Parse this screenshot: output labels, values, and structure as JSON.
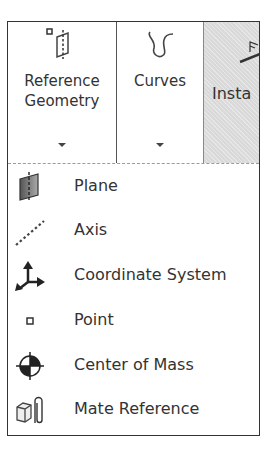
{
  "ribbon": {
    "buttons": [
      {
        "label": "Reference\nGeometry",
        "icon": "reference-geometry-icon",
        "has_dropdown": true
      },
      {
        "label": "Curves",
        "icon": "curves-icon",
        "has_dropdown": true
      },
      {
        "label": "Insta",
        "icon": "instant3d-icon",
        "has_dropdown": false,
        "state": "pressed"
      }
    ]
  },
  "menu": {
    "items": [
      {
        "label": "Plane",
        "icon": "plane-icon"
      },
      {
        "label": "Axis",
        "icon": "axis-icon"
      },
      {
        "label": "Coordinate System",
        "icon": "coordinate-system-icon"
      },
      {
        "label": "Point",
        "icon": "point-icon"
      },
      {
        "label": "Center of Mass",
        "icon": "center-of-mass-icon"
      },
      {
        "label": "Mate Reference",
        "icon": "mate-reference-icon"
      }
    ]
  },
  "colors": {
    "border": "#333333",
    "text": "#333333",
    "pressed_bg": "#d9d9d9",
    "separator": "#9a9a9a"
  }
}
